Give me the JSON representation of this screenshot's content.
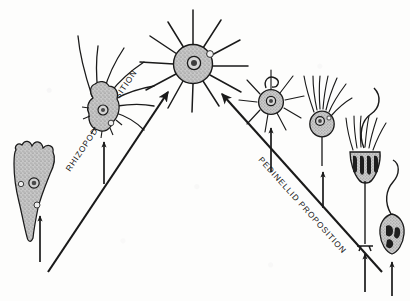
{
  "figure": {
    "background_color": "#fdfdfc",
    "ink_color": "#1a1a1a",
    "cell_fill_color": "#bdbdbd",
    "chloroplast_color": "#1e1e1e"
  },
  "branches": [
    {
      "id": "rhizopod",
      "label": "RHIZOPOD PROPOSITION",
      "side": "left",
      "label_rotation_deg": -34,
      "label_x": 70,
      "label_y": 172,
      "arrow": {
        "name": "rhizopod-branch-arrow",
        "x1": 48,
        "y1": 272,
        "x2": 168,
        "y2": 92,
        "head_angle_deg": -56
      }
    },
    {
      "id": "pedinellid",
      "label": "PEDINELLID PROPOSITION",
      "side": "right",
      "label_rotation_deg": 38,
      "label_x": 262,
      "label_y": 168,
      "arrow": {
        "name": "pedinellid-branch-arrow",
        "x1": 382,
        "y1": 272,
        "x2": 222,
        "y2": 94,
        "head_angle_deg": 48
      }
    }
  ],
  "organisms": [
    {
      "id": "lobose-amoeba",
      "name": "lobose-amoeba",
      "caption": "",
      "cx": 36,
      "cy": 188,
      "branch": "rhizopod",
      "stipple": true,
      "feeder_arrow": {
        "x": 40,
        "y1": 262,
        "y2": 216
      }
    },
    {
      "id": "filose-amoeba",
      "name": "filose-amoeba",
      "caption": "",
      "cx": 104,
      "cy": 110,
      "branch": "rhizopod",
      "stipple": true,
      "feeder_arrow": {
        "x": 104,
        "y1": 184,
        "y2": 142
      }
    },
    {
      "id": "centrohelid-heliozoan",
      "name": "centrohelid-heliozoan",
      "caption": "",
      "cx": 193,
      "cy": 62,
      "branch": "center",
      "stipple": true,
      "axopodia_count": 11
    },
    {
      "id": "small-heliozoan-flagellate",
      "name": "small-heliozoan-flagellate",
      "caption": "",
      "cx": 271,
      "cy": 100,
      "branch": "pedinellid",
      "stipple": true,
      "feeder_arrow": {
        "x": 271,
        "y1": 172,
        "y2": 128
      }
    },
    {
      "id": "stalked-pedinellid",
      "name": "stalked-pedinellid",
      "caption": "",
      "cx": 323,
      "cy": 122,
      "branch": "pedinellid",
      "stipple": true,
      "feeder_arrow": {
        "x": 323,
        "y1": 208,
        "y2": 170
      }
    },
    {
      "id": "colonial-pedinellid",
      "name": "colonial-pedinellid",
      "caption": "",
      "cx": 365,
      "cy": 160,
      "branch": "pedinellid",
      "stipple": true,
      "chloroplasts": 4,
      "feeder_arrow": {
        "x": 365,
        "y1": 290,
        "y2": 250
      }
    },
    {
      "id": "free-swimming-flagellate",
      "name": "free-swimming-flagellate",
      "caption": "",
      "cx": 392,
      "cy": 228,
      "branch": "pedinellid",
      "stipple": true,
      "feeder_arrow": {
        "x": 392,
        "y1": 292,
        "y2": 262
      }
    }
  ]
}
